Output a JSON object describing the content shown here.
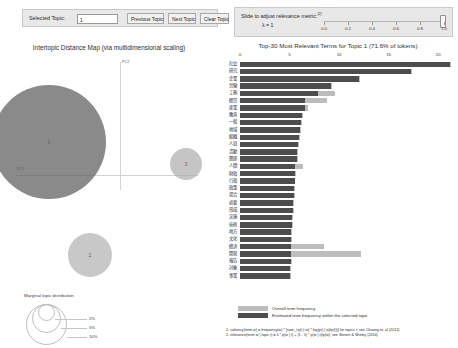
{
  "controls": {
    "selected_topic_label": "Selected Topic:",
    "selected_topic_value": "1",
    "previous_topic_label": "Previous Topic",
    "next_topic_label": "Next Topic",
    "clear_topic_label": "Clear Topic"
  },
  "relevance": {
    "title": "Slide to adjust relevance metric:",
    "superscript": "(2)",
    "lambda_text": "λ = 1",
    "lambda_value": 1.0,
    "ticks": [
      "0.0",
      "0.2",
      "0.4",
      "0.6",
      "0.8",
      "1.0"
    ]
  },
  "intertopic_map": {
    "title": "Intertopic Distance Map (via multidimensional scaling)",
    "x_axis_label": "PC1",
    "y_axis_label": "PC2",
    "topics": [
      {
        "id": "1",
        "label": "1"
      },
      {
        "id": "2",
        "label": "2"
      },
      {
        "id": "3",
        "label": "3"
      }
    ],
    "legend": {
      "title": "Marginal topic distribution",
      "sizes": [
        "2%",
        "5%",
        "10%"
      ]
    }
  },
  "chart_data": {
    "type": "bar",
    "title": "Top-30 Most Relevant Terms for Topic 1 (71.6% of tokens)",
    "xlabel": "",
    "ylabel": "",
    "orientation": "horizontal",
    "xlim": [
      0,
      22
    ],
    "xticks": [
      "0",
      "5",
      "10",
      "15",
      "20"
    ],
    "xtick_values": [
      0,
      5,
      10,
      15,
      20
    ],
    "grid": false,
    "legend_position": "bottom",
    "series": [
      {
        "name": "Overall term frequency",
        "color": "#bdbdbd"
      },
      {
        "name": "Estimated term frequency within the selected topic",
        "color": "#4d4d4d"
      }
    ],
    "categories": [
      "社会",
      "研究",
      "企業",
      "労働",
      "工務",
      "経営",
      "産業",
      "教育",
      "一般",
      "地域",
      "組織",
      "人員",
      "活動",
      "関係",
      "人間",
      "財政",
      "行政",
      "政策",
      "場合",
      "必要",
      "形成",
      "実施",
      "技術",
      "地方",
      "文化",
      "経済",
      "開発",
      "報告",
      "対象",
      "事業"
    ],
    "values_overall": [
      21.3,
      17.4,
      12.1,
      9.3,
      9.6,
      8.8,
      6.9,
      6.4,
      6.3,
      6.2,
      6.1,
      6.0,
      5.9,
      5.9,
      6.4,
      5.7,
      5.6,
      5.5,
      5.5,
      5.4,
      5.4,
      5.3,
      5.3,
      5.2,
      5.2,
      8.5,
      12.2,
      5.2,
      5.1,
      5.1
    ],
    "values_topic": [
      21.2,
      17.3,
      12.0,
      9.2,
      7.9,
      6.6,
      6.6,
      6.3,
      6.2,
      6.1,
      6.0,
      5.9,
      5.8,
      5.8,
      5.6,
      5.6,
      5.5,
      5.4,
      5.4,
      5.3,
      5.3,
      5.2,
      5.2,
      5.1,
      5.1,
      5.1,
      5.1,
      5.1,
      5.0,
      5.0
    ]
  },
  "footnotes": [
    "1. saliency(term w) = frequency(w) * [sum_t p(t | w) * log(p(t | w)/p(t))] for topics t; see Chuang et. al (2012)",
    "2. relevance(term w | topic t) = λ * p(w | t) + (1 - λ) * p(w | t)/p(w); see Sievert & Shirley (2014)"
  ]
}
